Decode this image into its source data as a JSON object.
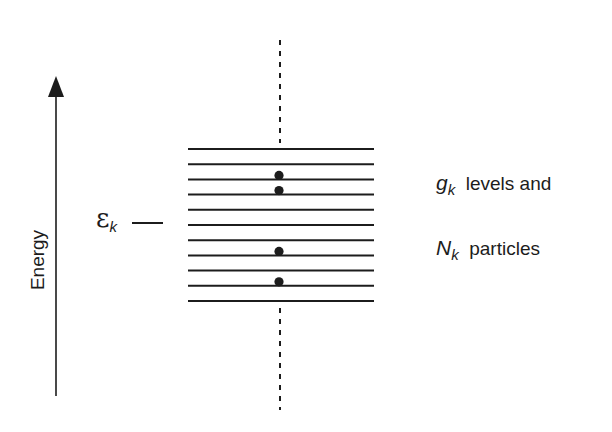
{
  "diagram": {
    "axis": {
      "label": "Energy",
      "direction": "up"
    },
    "energy_level_marker": {
      "symbol": "ε",
      "subscript": "k"
    },
    "annotations": [
      {
        "symbol": "g",
        "subscript": "k",
        "text": "levels and"
      },
      {
        "symbol": "N",
        "subscript": "k",
        "text": "particles"
      }
    ],
    "levels": {
      "count": 11,
      "occupied_level_indices_from_top": [
        2,
        3,
        7,
        9
      ],
      "particle_count": 4
    },
    "colors": {
      "ink": "#1c1c1c",
      "background": "#ffffff"
    }
  }
}
